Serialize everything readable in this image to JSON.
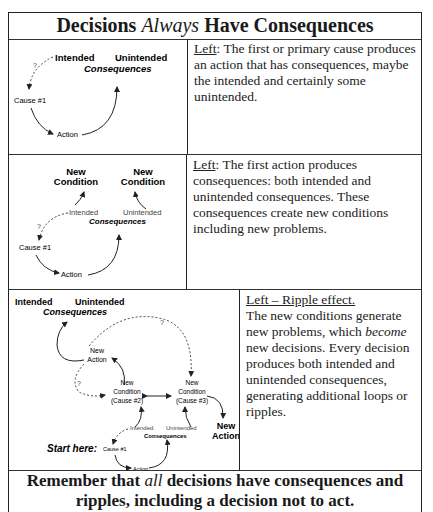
{
  "title": {
    "before": "Decisions ",
    "emph": "Always",
    "after": " Have Consequences"
  },
  "panels": [
    {
      "diagram": {
        "intended": "Intended",
        "unintended": "Unintended",
        "consequences": "Consequences",
        "cause": "Cause #1",
        "action": "Action",
        "question": "?"
      },
      "desc": {
        "lead": "Left",
        "body": ": The first or primary cause produces an action that has consequences, maybe the intended and certainly some unintended."
      }
    },
    {
      "diagram": {
        "new_condition_1": [
          "New",
          "Condition"
        ],
        "new_condition_2": [
          "New",
          "Condition"
        ],
        "intended": "Intended",
        "unintended": "Unintended",
        "consequences": "Consequences",
        "cause": "Cause #1",
        "action": "Action",
        "question": "?"
      },
      "desc": {
        "lead": "Left",
        "body": ": The first action produces consequences: both intended and unintended consequences. These consequences create new conditions including new problems."
      }
    },
    {
      "diagram": {
        "top_intended": "Intended",
        "top_unintended": "Unintended",
        "top_consequences": "Consequences",
        "new_action_top": [
          "New",
          "Action"
        ],
        "new_condition_2": [
          "New",
          "Condition",
          "(Cause #2)"
        ],
        "new_condition_3": [
          "New",
          "Condition",
          "(Cause #3)"
        ],
        "new_action_right": [
          "New",
          "Action"
        ],
        "intended": "Intended",
        "unintended": "Unintended",
        "consequences": "Consequences",
        "start_here": "Start here:",
        "cause": "Cause #1",
        "action": "Action",
        "question": "?"
      },
      "desc": {
        "lead": "Left – Ripple effect.",
        "body_before": "The new conditions generate new problems, which ",
        "body_emph": "become",
        "body_after": " new decisions. Every decision produces both intended and unintended consequences, generating additional loops or ripples."
      }
    }
  ],
  "footer": {
    "before": "Remember that ",
    "emph": "all",
    "after": " decisions have consequences and ripples, including a decision not to act."
  }
}
